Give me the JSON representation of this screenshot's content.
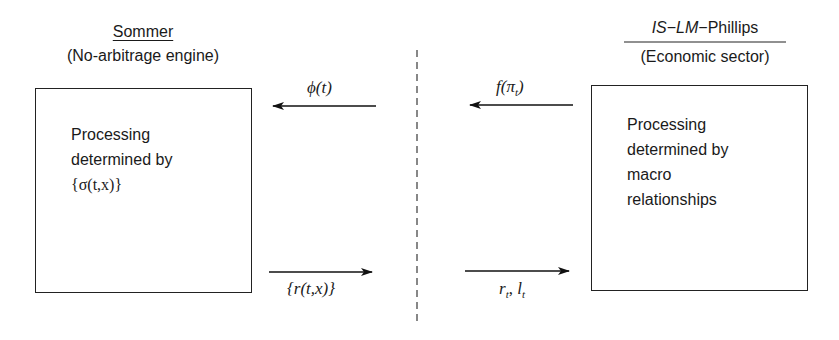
{
  "diagram": {
    "left_module": {
      "title": "Sommer",
      "subtitle": "(No-arbitrage engine)",
      "box_lines": [
        "Processing",
        "determined by",
        "{σ(t,x)}"
      ]
    },
    "right_module": {
      "title_parts": [
        "IS",
        "−",
        "LM",
        "−Phillips"
      ],
      "subtitle": "(Economic sector)",
      "box_lines": [
        "Processing",
        "determined by",
        "macro",
        "relationships"
      ]
    },
    "arrows": [
      {
        "id": "phi",
        "label": "ϕ(t)",
        "direction": "left",
        "from": "divider",
        "to": "left_module"
      },
      {
        "id": "f_pi",
        "label_main": "f(π",
        "label_sub": "t",
        "label_end": ")",
        "direction": "left",
        "from": "right_module",
        "to": "divider"
      },
      {
        "id": "r_tx",
        "label": "{r(t,x)}",
        "direction": "right",
        "from": "left_module",
        "to": "divider"
      },
      {
        "id": "r_l",
        "label_r": "r",
        "label_l": "l",
        "label_sub": "t",
        "direction": "right",
        "from": "divider",
        "to": "right_module"
      }
    ],
    "divider": {
      "style": "dashed",
      "color": "#555555"
    }
  }
}
